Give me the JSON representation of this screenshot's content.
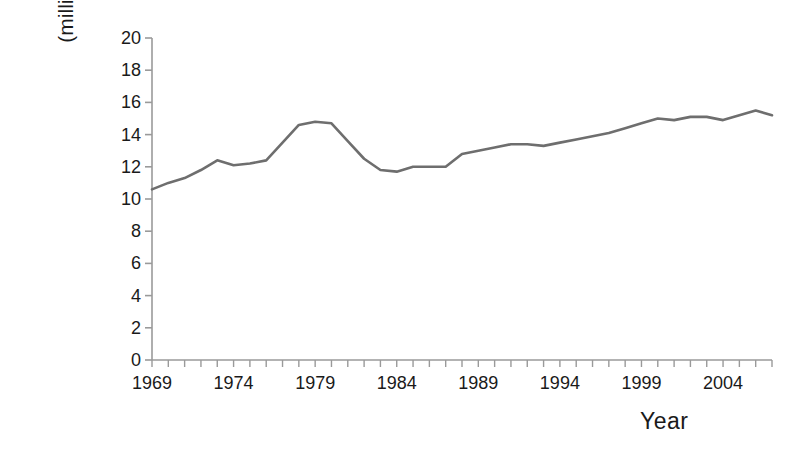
{
  "chart_data": {
    "type": "line",
    "title": "",
    "subtitle": "",
    "xlabel": "Year",
    "ylabel": "Quantity (millions of barrels per day)",
    "ylabel_line1": "Quantity",
    "ylabel_line2": "(millions of barrels per day)",
    "ylim": [
      0,
      20
    ],
    "xlim": [
      1969,
      2007
    ],
    "grid": false,
    "legend": null,
    "legend_position": "none",
    "y_ticks": [
      0,
      2,
      4,
      6,
      8,
      10,
      12,
      14,
      16,
      18,
      20
    ],
    "y_tick_labels": [
      "0",
      "2",
      "4",
      "6",
      "8",
      "10",
      "12",
      "14",
      "16",
      "18",
      "20"
    ],
    "x_ticks": [
      1969,
      1974,
      1979,
      1984,
      1989,
      1994,
      1999,
      2004
    ],
    "x_tick_labels": [
      "1969",
      "1974",
      "1979",
      "1984",
      "1989",
      "1994",
      "1999",
      "2004"
    ],
    "x_minor_tick_interval": 1,
    "line_color": "#6e6e6e",
    "line_width": 2.6,
    "series": [
      {
        "name": "Quantity",
        "x": [
          1969,
          1970,
          1971,
          1972,
          1973,
          1974,
          1975,
          1976,
          1977,
          1978,
          1979,
          1980,
          1981,
          1982,
          1983,
          1984,
          1985,
          1986,
          1987,
          1988,
          1989,
          1990,
          1991,
          1992,
          1993,
          1994,
          1995,
          1996,
          1997,
          1998,
          1999,
          2000,
          2001,
          2002,
          2003,
          2004,
          2005,
          2006,
          2007
        ],
        "values": [
          10.6,
          11.0,
          11.3,
          11.8,
          12.4,
          12.1,
          12.2,
          12.4,
          13.5,
          14.6,
          14.8,
          14.7,
          13.6,
          12.5,
          11.8,
          11.7,
          12.0,
          12.0,
          12.0,
          12.8,
          13.0,
          13.2,
          13.4,
          13.4,
          13.3,
          13.5,
          13.7,
          13.9,
          14.1,
          14.4,
          14.7,
          15.0,
          14.9,
          15.1,
          15.1,
          14.9,
          15.2,
          15.5,
          15.2
        ]
      }
    ]
  },
  "axis": {
    "y_title_line1": "Quantity",
    "y_title_line2": "(millions of barrels per day)",
    "x_title": "Year"
  }
}
